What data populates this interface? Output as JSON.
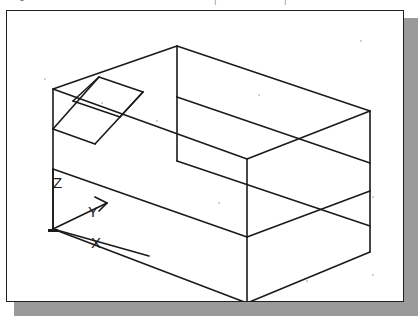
{
  "page": {
    "background_color": "#ffffff",
    "shadow_color": "#999a99",
    "frame_border_color": "#22201f",
    "line_color": "#1a1a1a"
  },
  "top_bleed": {
    "description": "faint clipped descenders of a text line from the page above",
    "glyphs": [
      {
        "char": "●",
        "x": 18
      },
      {
        "char": "•",
        "x": 60
      },
      {
        "char": "—",
        "x": 96
      },
      {
        "char": "•",
        "x": 140
      },
      {
        "char": "•",
        "x": 178
      },
      {
        "char": "|",
        "x": 214
      },
      {
        "char": "•",
        "x": 248
      },
      {
        "char": "|",
        "x": 284
      },
      {
        "char": "•",
        "x": 322
      }
    ]
  },
  "figure": {
    "view": "isometric",
    "ucs_icon": {
      "name": "ucs-axis-tripod",
      "origin": {
        "x": 46,
        "y": 218
      },
      "axes": [
        {
          "label": "X",
          "label_x": 90,
          "label_y": 237,
          "tip_x": 140,
          "tip_y": 243
        },
        {
          "label": "Y",
          "label_x": 87,
          "label_y": 206,
          "tip_x": 100,
          "tip_y": 192
        },
        {
          "label": "Z",
          "label_x": 52,
          "label_y": 177,
          "tip_x": 46,
          "tip_y": 158
        }
      ]
    },
    "solid": {
      "name": "rectangular-block",
      "vertices": {
        "top_back": {
          "x": 170,
          "y": 35
        },
        "top_left": {
          "x": 46,
          "y": 78
        },
        "top_right": {
          "x": 363,
          "y": 100
        },
        "top_front": {
          "x": 240,
          "y": 148
        },
        "mid_left": {
          "x": 46,
          "y": 158
        },
        "mid_front": {
          "x": 240,
          "y": 226
        },
        "mid_right": {
          "x": 363,
          "y": 180
        },
        "bottom_left": {
          "x": 46,
          "y": 218
        },
        "bottom_front": {
          "x": 240,
          "y": 292
        },
        "bottom_right": {
          "x": 363,
          "y": 241
        }
      },
      "edge_count": 18,
      "bands": 2
    },
    "slot": {
      "name": "angled-slot-parallelogram",
      "description": "inclined rectangular slot cut through the upper-left top face",
      "corners": [
        {
          "x": 92,
          "y": 66
        },
        {
          "x": 136,
          "y": 81
        },
        {
          "x": 88,
          "y": 133
        },
        {
          "x": 46,
          "y": 118
        }
      ]
    },
    "specks": [
      {
        "x": 38,
        "y": 68
      },
      {
        "x": 150,
        "y": 110
      },
      {
        "x": 252,
        "y": 84
      },
      {
        "x": 354,
        "y": 30
      },
      {
        "x": 140,
        "y": 300
      },
      {
        "x": 262,
        "y": 304
      },
      {
        "x": 366,
        "y": 186
      },
      {
        "x": 300,
        "y": 270
      },
      {
        "x": 366,
        "y": 264
      },
      {
        "x": 212,
        "y": 192
      },
      {
        "x": 95,
        "y": 92
      }
    ]
  }
}
